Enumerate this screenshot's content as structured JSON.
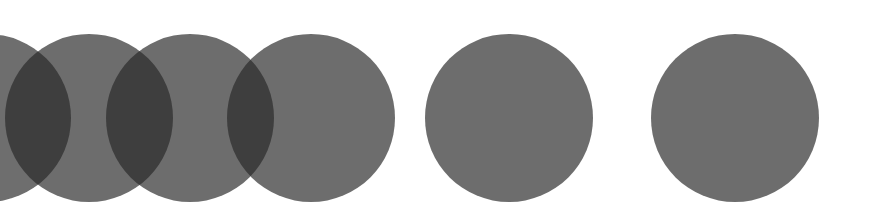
{
  "canvas": {
    "width": 874,
    "height": 216,
    "background": "#ffffff"
  },
  "style": {
    "circle_fill": "#282828",
    "circle_opacity": 0.68,
    "single_tone": "#6d6d6d",
    "overlap_tone": "#3d3d3d"
  },
  "circles": [
    {
      "id": "circle-1",
      "cx": -13,
      "cy": 118,
      "r": 84,
      "overlaps_next": true,
      "partially_offscreen": true
    },
    {
      "id": "circle-2",
      "cx": 89,
      "cy": 118,
      "r": 84,
      "overlaps_next": true
    },
    {
      "id": "circle-3",
      "cx": 190,
      "cy": 118,
      "r": 84,
      "overlaps_next": true
    },
    {
      "id": "circle-4",
      "cx": 311,
      "cy": 118,
      "r": 84,
      "overlaps_next": false
    },
    {
      "id": "circle-5",
      "cx": 509,
      "cy": 118,
      "r": 84,
      "overlaps_next": false
    },
    {
      "id": "circle-6",
      "cx": 735,
      "cy": 118,
      "r": 84,
      "overlaps_next": false
    }
  ]
}
